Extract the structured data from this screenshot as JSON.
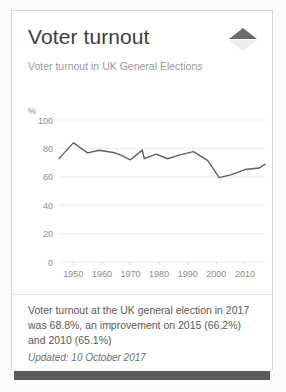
{
  "card": {
    "title": "Voter turnout",
    "subtitle": "Voter turnout in UK General Elections",
    "note": "Voter turnout at the UK general election in 2017 was 68.8%, an improvement on 2015 (66.2%) and 2010 (65.1%)",
    "updated": "Updated: 10 October 2017",
    "spinner_up_icon": "triangle-up-icon",
    "spinner_down_icon": "triangle-down-icon",
    "accent_color": "#6b6b6b",
    "line_color": "#5e5e5e",
    "grid_color": "#ebebeb",
    "border_color": "#d6d6d6"
  },
  "chart_data": {
    "type": "line",
    "title": "Voter turnout",
    "subtitle": "Voter turnout in UK General Elections",
    "xlabel": "",
    "ylabel": "%",
    "ylim": [
      0,
      100
    ],
    "xlim": [
      1945,
      2017
    ],
    "yticks": [
      0,
      20,
      40,
      60,
      80,
      100
    ],
    "xticks": [
      1950,
      1960,
      1970,
      1980,
      1990,
      2000,
      2010
    ],
    "grid": true,
    "legend": "none",
    "series": [
      {
        "name": "Voter turnout",
        "x": [
          1945,
          1950,
          1951,
          1955,
          1959,
          1964,
          1966,
          1970,
          1974.1,
          1974.8,
          1979,
          1983,
          1987,
          1992,
          1997,
          2001,
          2005,
          2010,
          2015,
          2017
        ],
        "values": [
          72.8,
          83.9,
          82.6,
          76.8,
          78.7,
          77.1,
          75.8,
          72.0,
          78.8,
          72.8,
          76.0,
          72.7,
          75.3,
          77.7,
          71.4,
          59.4,
          61.4,
          65.1,
          66.2,
          68.8
        ]
      }
    ]
  }
}
